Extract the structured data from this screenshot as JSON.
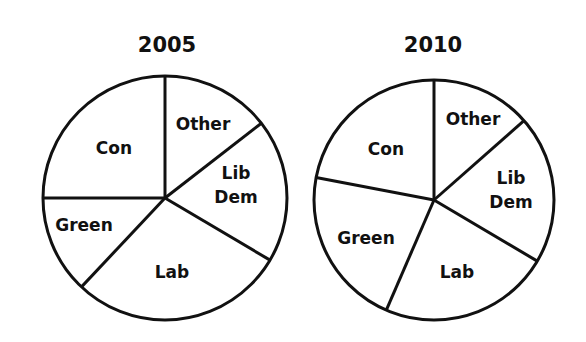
{
  "chart_data": [
    {
      "type": "pie",
      "title": "2005",
      "start_angle_deg": 0,
      "direction": "clockwise",
      "slices": [
        {
          "label": "Other",
          "lines": [
            "Other"
          ],
          "value": 14.5
        },
        {
          "label": "Lib Dem",
          "lines": [
            "Lib",
            "Dem"
          ],
          "value": 19
        },
        {
          "label": "Lab",
          "lines": [
            "Lab"
          ],
          "value": 28.5
        },
        {
          "label": "Green",
          "lines": [
            "Green"
          ],
          "value": 13
        },
        {
          "label": "Con",
          "lines": [
            "Con"
          ],
          "value": 25
        }
      ],
      "unit": "%",
      "legend": "none (labels inside slices)"
    },
    {
      "type": "pie",
      "title": "2010",
      "start_angle_deg": 0,
      "direction": "clockwise",
      "slices": [
        {
          "label": "Other",
          "lines": [
            "Other"
          ],
          "value": 13.5
        },
        {
          "label": "Lib Dem",
          "lines": [
            "Lib",
            "Dem"
          ],
          "value": 20
        },
        {
          "label": "Lab",
          "lines": [
            "Lab"
          ],
          "value": 23
        },
        {
          "label": "Green",
          "lines": [
            "Green"
          ],
          "value": 21.5
        },
        {
          "label": "Con",
          "lines": [
            "Con"
          ],
          "value": 22
        }
      ],
      "unit": "%",
      "legend": "none (labels inside slices)"
    }
  ],
  "layout": {
    "charts": [
      {
        "cx": 165,
        "cy": 198,
        "r": 122,
        "title_x": 167,
        "title_y": 33,
        "label_pos": {
          "Other": [
            203,
            124
          ],
          "Lib Dem": [
            236,
            185
          ],
          "Lab": [
            172,
            272
          ],
          "Green": [
            84,
            225
          ],
          "Con": [
            114,
            148
          ]
        }
      },
      {
        "cx": 434,
        "cy": 200,
        "r": 120,
        "title_x": 433,
        "title_y": 33,
        "label_pos": {
          "Other": [
            473,
            119
          ],
          "Lib Dem": [
            511,
            190
          ],
          "Lab": [
            457,
            272
          ],
          "Green": [
            366,
            238
          ],
          "Con": [
            386,
            149
          ]
        }
      }
    ],
    "stroke_color": "#111111",
    "fill_color": "#ffffff"
  }
}
